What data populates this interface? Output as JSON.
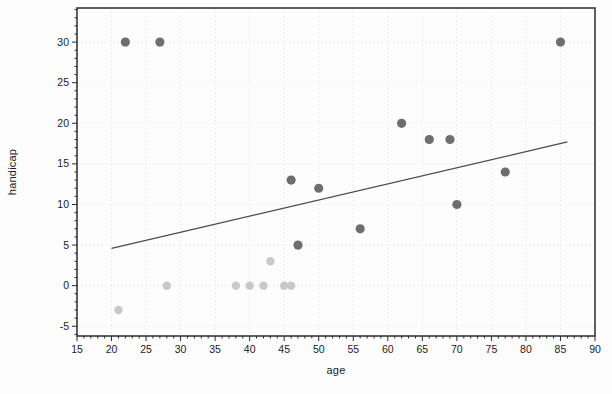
{
  "chart_data": {
    "type": "scatter",
    "title": "",
    "xlabel": "age",
    "ylabel": "handicap",
    "xlim": [
      15,
      90
    ],
    "ylim": [
      -6.2,
      34.2
    ],
    "x_ticks": [
      15,
      20,
      25,
      30,
      35,
      40,
      45,
      50,
      55,
      60,
      65,
      70,
      75,
      80,
      85,
      90
    ],
    "y_ticks": [
      -5,
      0,
      5,
      10,
      15,
      20,
      25,
      30
    ],
    "minor_tick_step": 1,
    "grid": "dotted-major",
    "legend": "none",
    "colors": {
      "spine": "#2b2b2b",
      "tick": "#2b2b2b",
      "tick_label": "#1c1c1c",
      "grid": "#e8e8e8",
      "trend_line": "#4a4a4a",
      "dark_marker": "#6e6e6e",
      "light_marker": "#c9c9c9"
    },
    "series": [
      {
        "name": "light-gray-group",
        "color": "#c9c9c9",
        "marker": "circle",
        "marker_radius": 4.2,
        "points": [
          [
            21,
            -3
          ],
          [
            28,
            0
          ],
          [
            38,
            0
          ],
          [
            40,
            0
          ],
          [
            42,
            0
          ],
          [
            43,
            3
          ],
          [
            45,
            0
          ],
          [
            46,
            0
          ]
        ]
      },
      {
        "name": "dark-gray-group",
        "color": "#6e6e6e",
        "marker": "circle",
        "marker_radius": 4.6,
        "points": [
          [
            22,
            30
          ],
          [
            27,
            30
          ],
          [
            46,
            13
          ],
          [
            47,
            5
          ],
          [
            50,
            12
          ],
          [
            56,
            7
          ],
          [
            62,
            20
          ],
          [
            66,
            18
          ],
          [
            69,
            18
          ],
          [
            70,
            10
          ],
          [
            77,
            14
          ],
          [
            85,
            30
          ]
        ]
      }
    ],
    "trend_line": {
      "x1": 20,
      "y1": 4.6,
      "x2": 86,
      "y2": 17.7
    }
  }
}
